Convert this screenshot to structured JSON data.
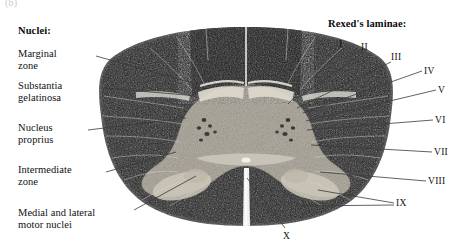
{
  "figure": {
    "tag": "(b)",
    "stain_tone": "dark speckled white matter with pale gray matter butterfly"
  },
  "left_panel": {
    "heading": "Nuclei:",
    "items": [
      {
        "label": "Marginal\nzone",
        "x": 18,
        "y": 48,
        "anchor_x": 96,
        "anchor_y": 56,
        "target_x": 196,
        "target_y": 84
      },
      {
        "label": "Substantia\ngelatinosa",
        "x": 18,
        "y": 80,
        "anchor_x": 104,
        "anchor_y": 88,
        "target_x": 198,
        "target_y": 96
      },
      {
        "label": "Nucleus\nproprius",
        "x": 18,
        "y": 122,
        "anchor_x": 88,
        "anchor_y": 130,
        "target_x": 186,
        "target_y": 118
      },
      {
        "label": "Intermediate\nzone",
        "x": 18,
        "y": 164,
        "anchor_x": 106,
        "anchor_y": 172,
        "target_x": 176,
        "target_y": 152
      },
      {
        "label": "Medial and lateral\nmotor nuclei",
        "x": 18,
        "y": 207,
        "anchor_x": 134,
        "anchor_y": 210,
        "target_x": 196,
        "target_y": 176
      }
    ]
  },
  "right_panel": {
    "heading": "Rexed's laminae:",
    "items": [
      {
        "label": "I",
        "x": 339,
        "y": 39,
        "anchor_x": 341,
        "anchor_y": 50,
        "target_x": 288,
        "target_y": 104
      },
      {
        "label": "II",
        "x": 361,
        "y": 42,
        "anchor_x": 363,
        "anchor_y": 53,
        "target_x": 293,
        "target_y": 101
      },
      {
        "label": "III",
        "x": 391,
        "y": 52,
        "anchor_x": 391,
        "anchor_y": 62,
        "target_x": 297,
        "target_y": 108
      },
      {
        "label": "IV",
        "x": 424,
        "y": 66,
        "anchor_x": 422,
        "anchor_y": 71,
        "target_x": 303,
        "target_y": 113
      },
      {
        "label": "V",
        "x": 438,
        "y": 85,
        "anchor_x": 436,
        "anchor_y": 90,
        "target_x": 306,
        "target_y": 121
      },
      {
        "label": "VI",
        "x": 435,
        "y": 115,
        "anchor_x": 433,
        "anchor_y": 120,
        "target_x": 307,
        "target_y": 130
      },
      {
        "label": "VII",
        "x": 434,
        "y": 147,
        "anchor_x": 432,
        "anchor_y": 152,
        "target_x": 311,
        "target_y": 145
      },
      {
        "label": "VIII",
        "x": 428,
        "y": 176,
        "anchor_x": 426,
        "anchor_y": 181,
        "target_x": 320,
        "target_y": 172
      },
      {
        "label": "IX",
        "x": 396,
        "y": 198,
        "anchor_x": 394,
        "anchor_y": 203,
        "target_x": 318,
        "target_y": 190
      },
      {
        "label": "IX2",
        "x": 396,
        "y": 198,
        "anchor_x": 394,
        "anchor_y": 205,
        "target_x": 300,
        "target_y": 206
      },
      {
        "label": "X",
        "x": 283,
        "y": 231,
        "anchor_x": 285,
        "anchor_y": 228,
        "target_x": 247,
        "target_y": 178
      }
    ],
    "numerals_visible": [
      "I",
      "II",
      "III",
      "IV",
      "V",
      "VI",
      "VII",
      "VIII",
      "IX",
      "X"
    ]
  },
  "colors": {
    "text": "#111111",
    "leader_line": "#3a3a3a",
    "white_matter": "#2b2b2b",
    "gray_matter": "#b9b4a8",
    "background": "#ffffff"
  }
}
